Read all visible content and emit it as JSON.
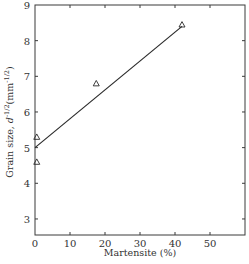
{
  "chart_data": {
    "type": "scatter",
    "title": "",
    "xlabel": "Martensite (%)",
    "ylabel": "Grain size, d^-1/2(mm^-1/2)",
    "ylabel_parts": {
      "main": "Grain size, ",
      "var": "d",
      "exp1": "-1/2",
      "unit_open": "(mm",
      "exp2": "-1/2",
      "unit_close": ")"
    },
    "xlim": [
      0,
      60
    ],
    "ylim": [
      2.55,
      9
    ],
    "xticks": [
      0,
      10,
      20,
      30,
      40,
      50
    ],
    "yticks": [
      3,
      4,
      5,
      6,
      7,
      8,
      9
    ],
    "grid": false,
    "legend": null,
    "marker": "open-triangle",
    "series": [
      {
        "name": "measured",
        "points": [
          {
            "x": 0.5,
            "y": 5.3
          },
          {
            "x": 0.5,
            "y": 4.6
          },
          {
            "x": 17.5,
            "y": 6.8
          },
          {
            "x": 42,
            "y": 8.45
          }
        ]
      }
    ],
    "fit_line": {
      "x": [
        0,
        42
      ],
      "y": [
        5.0,
        8.4
      ]
    }
  }
}
